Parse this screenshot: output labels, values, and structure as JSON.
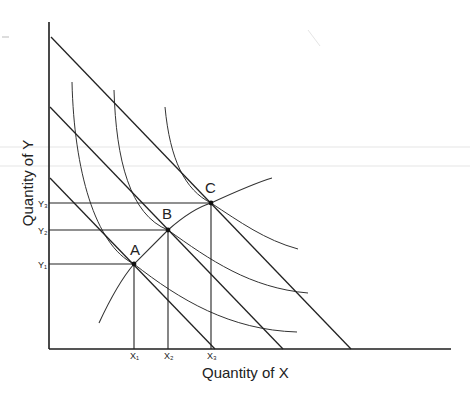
{
  "diagram": {
    "type": "indifference-curve / budget-line diagram (income-consumption path)",
    "x_axis": {
      "label": "Quantity of X",
      "ticks": [
        "X₁",
        "X₂",
        "X₃"
      ]
    },
    "y_axis": {
      "label": "Quantity of Y",
      "ticks": [
        "Y₁",
        "Y₂",
        "Y₃"
      ]
    },
    "points": [
      {
        "label": "A",
        "x_tick": "X₁",
        "y_tick": "Y₁"
      },
      {
        "label": "B",
        "x_tick": "X₂",
        "y_tick": "Y₂"
      },
      {
        "label": "C",
        "x_tick": "X₃",
        "y_tick": "Y₃"
      }
    ],
    "budget_lines": 3,
    "indifference_curves": 3,
    "expansion_path": "curve through A, B, C"
  },
  "colors": {
    "line": "#222222",
    "background": "#ffffff",
    "artifact": "#e6e6e6"
  }
}
